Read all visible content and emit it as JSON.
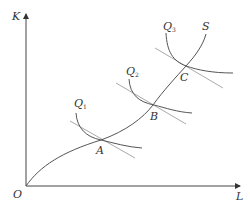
{
  "diagram": {
    "type": "isoquant-expansion-path",
    "axes": {
      "y_label": "K",
      "x_label": "L",
      "origin_label": "O"
    },
    "expansion_path_label": "S",
    "isoquants": [
      {
        "label": "Q",
        "subscript": "1",
        "point": "A"
      },
      {
        "label": "Q",
        "subscript": "2",
        "point": "B"
      },
      {
        "label": "Q",
        "subscript": "3",
        "point": "C"
      }
    ],
    "tangent_points": [
      "A",
      "B",
      "C"
    ],
    "colors": {
      "axis": "#444444",
      "curve": "#555555",
      "tangent": "#aaaaaa"
    }
  }
}
